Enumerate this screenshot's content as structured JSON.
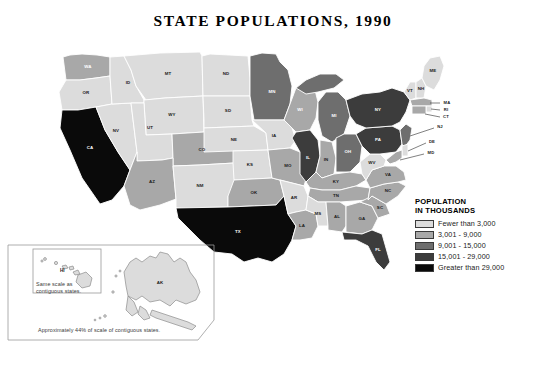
{
  "title": "STATE  POPULATIONS, 1990",
  "legend": {
    "title_line1": "POPULATION",
    "title_line2": "IN THOUSANDS",
    "classes": [
      {
        "label": "Fewer than 3,000",
        "color": "#dcdcdc",
        "key": "c1"
      },
      {
        "label": "3,001 - 9,000",
        "color": "#a8a8a8",
        "key": "c2"
      },
      {
        "label": "9,001 - 15,000",
        "color": "#6e6e6e",
        "key": "c3"
      },
      {
        "label": "15,001 - 29,000",
        "color": "#3c3c3c",
        "key": "c4"
      },
      {
        "label": "Greater than 29,000",
        "color": "#0a0a0a",
        "key": "c5"
      }
    ]
  },
  "insets": {
    "hawaii_label": "HI",
    "hawaii_note": "Same scale as contiguous states.",
    "alaska_label": "AK",
    "alaska_note": "Approximately 44% of scale of contiguous states."
  },
  "chart_data": {
    "type": "map",
    "title": "STATE  POPULATIONS, 1990",
    "units": "thousands",
    "classes": [
      "Fewer than 3,000",
      "3,001 - 9,000",
      "9,001 - 15,000",
      "15,001 - 29,000",
      "Greater than 29,000"
    ],
    "states": [
      {
        "abbr": "WA",
        "class": 2
      },
      {
        "abbr": "OR",
        "class": 1
      },
      {
        "abbr": "CA",
        "class": 5
      },
      {
        "abbr": "NV",
        "class": 1
      },
      {
        "abbr": "ID",
        "class": 1
      },
      {
        "abbr": "MT",
        "class": 1
      },
      {
        "abbr": "WY",
        "class": 1
      },
      {
        "abbr": "UT",
        "class": 1
      },
      {
        "abbr": "AZ",
        "class": 2
      },
      {
        "abbr": "CO",
        "class": 2
      },
      {
        "abbr": "NM",
        "class": 1
      },
      {
        "abbr": "ND",
        "class": 1
      },
      {
        "abbr": "SD",
        "class": 1
      },
      {
        "abbr": "NE",
        "class": 1
      },
      {
        "abbr": "KS",
        "class": 1
      },
      {
        "abbr": "OK",
        "class": 2
      },
      {
        "abbr": "TX",
        "class": 5
      },
      {
        "abbr": "MN",
        "class": 3
      },
      {
        "abbr": "IA",
        "class": 1
      },
      {
        "abbr": "MO",
        "class": 2
      },
      {
        "abbr": "AR",
        "class": 1
      },
      {
        "abbr": "LA",
        "class": 2
      },
      {
        "abbr": "WI",
        "class": 2
      },
      {
        "abbr": "IL",
        "class": 4
      },
      {
        "abbr": "MI",
        "class": 3
      },
      {
        "abbr": "IN",
        "class": 2
      },
      {
        "abbr": "OH",
        "class": 3
      },
      {
        "abbr": "KY",
        "class": 2
      },
      {
        "abbr": "TN",
        "class": 2
      },
      {
        "abbr": "MS",
        "class": 1
      },
      {
        "abbr": "AL",
        "class": 2
      },
      {
        "abbr": "GA",
        "class": 2
      },
      {
        "abbr": "FL",
        "class": 4
      },
      {
        "abbr": "SC",
        "class": 2
      },
      {
        "abbr": "NC",
        "class": 2
      },
      {
        "abbr": "VA",
        "class": 2
      },
      {
        "abbr": "WV",
        "class": 1
      },
      {
        "abbr": "PA",
        "class": 4
      },
      {
        "abbr": "NY",
        "class": 4
      },
      {
        "abbr": "VT",
        "class": 1
      },
      {
        "abbr": "NH",
        "class": 1
      },
      {
        "abbr": "ME",
        "class": 1
      },
      {
        "abbr": "MA",
        "class": 2
      },
      {
        "abbr": "RI",
        "class": 1
      },
      {
        "abbr": "CT",
        "class": 2
      },
      {
        "abbr": "NJ",
        "class": 3
      },
      {
        "abbr": "DE",
        "class": 1
      },
      {
        "abbr": "MD",
        "class": 2
      },
      {
        "abbr": "AK",
        "class": 1
      },
      {
        "abbr": "HI",
        "class": 1
      }
    ]
  }
}
